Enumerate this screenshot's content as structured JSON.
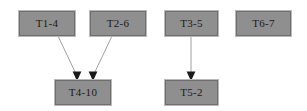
{
  "diagram": {
    "type": "directed-graph",
    "background_color": "#ffffff",
    "node_fill_color": "#8f8f8f",
    "node_border_color": "#6e6e6e",
    "node_text_color": "#1a1a1a",
    "edge_color": "#a0a0a0",
    "arrowhead_color": "#1a1a1a",
    "nodes": [
      {
        "id": "T1-4",
        "label": "T1-4",
        "x": 19,
        "y": 11,
        "w": 56,
        "h": 25
      },
      {
        "id": "T2-6",
        "label": "T2-6",
        "x": 90,
        "y": 11,
        "w": 56,
        "h": 25
      },
      {
        "id": "T3-5",
        "label": "T3-5",
        "x": 165,
        "y": 11,
        "w": 53,
        "h": 25
      },
      {
        "id": "T6-7",
        "label": "T6-7",
        "x": 236,
        "y": 11,
        "w": 55,
        "h": 25
      },
      {
        "id": "T4-10",
        "label": "T4-10",
        "x": 55,
        "y": 80,
        "w": 56,
        "h": 25
      },
      {
        "id": "T5-2",
        "label": "T5-2",
        "x": 165,
        "y": 80,
        "w": 53,
        "h": 25
      }
    ],
    "edges": [
      {
        "from": "T1-4",
        "to": "T4-10",
        "x1": 58,
        "y1": 36,
        "x2": 77,
        "y2": 78
      },
      {
        "from": "T2-6",
        "to": "T4-10",
        "x1": 112,
        "y1": 36,
        "x2": 92,
        "y2": 78
      },
      {
        "from": "T3-5",
        "to": "T5-2",
        "x1": 191,
        "y1": 36,
        "x2": 191,
        "y2": 78
      }
    ]
  }
}
